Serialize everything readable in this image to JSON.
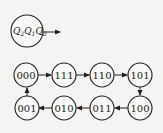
{
  "legend": {
    "label_parts": [
      {
        "var": "Q",
        "sub": "2"
      },
      {
        "var": "Q",
        "sub": "1"
      },
      {
        "var": "Q",
        "sub": "0"
      }
    ]
  },
  "states": [
    {
      "label": "000"
    },
    {
      "label": "111"
    },
    {
      "label": "110"
    },
    {
      "label": "101"
    },
    {
      "label": "100"
    },
    {
      "label": "011"
    },
    {
      "label": "010"
    },
    {
      "label": "001"
    }
  ],
  "transitions": [
    {
      "from": "000",
      "to": "111"
    },
    {
      "from": "111",
      "to": "110"
    },
    {
      "from": "110",
      "to": "101"
    },
    {
      "from": "101",
      "to": "100"
    },
    {
      "from": "100",
      "to": "011"
    },
    {
      "from": "011",
      "to": "010"
    },
    {
      "from": "010",
      "to": "001"
    },
    {
      "from": "001",
      "to": "000"
    }
  ]
}
